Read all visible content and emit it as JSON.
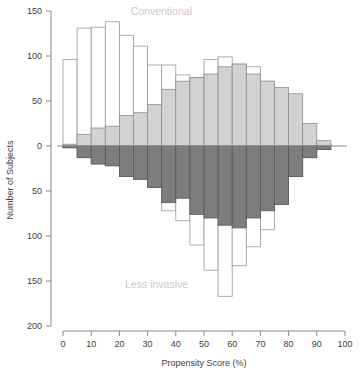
{
  "chart_data": {
    "type": "bar",
    "subtype": "back-to-back-histogram",
    "title": "",
    "xlabel": "Propensity Score (%)",
    "ylabel": "Number of Subjects",
    "xlim": [
      0,
      100
    ],
    "ylim": [
      -200,
      150
    ],
    "grid": false,
    "legend_position": "inside-annotations",
    "x_ticks": [
      0,
      10,
      20,
      30,
      40,
      50,
      60,
      70,
      80,
      90,
      100
    ],
    "x_tick_labels": [
      "0",
      "10",
      "20",
      "30",
      "40",
      "50",
      "60",
      "70",
      "80",
      "90",
      "100"
    ],
    "y_ticks": [
      150,
      100,
      50,
      0,
      -50,
      -100,
      -150,
      -200
    ],
    "y_tick_labels": [
      "150",
      "100",
      "50",
      "0",
      "50",
      "100",
      "150",
      "200"
    ],
    "annotations": [
      {
        "text": "Conventional",
        "x": 24,
        "y": 146,
        "color": "#c9c9c9"
      },
      {
        "text": "Less invasive",
        "x": 22,
        "y": -158,
        "color": "#c9c9c9"
      }
    ],
    "bin_width": 5,
    "bin_starts": [
      0,
      5,
      10,
      15,
      20,
      25,
      30,
      35,
      40,
      45,
      50,
      55,
      60,
      65,
      70,
      75,
      80,
      85,
      90,
      95
    ],
    "series": [
      {
        "name": "Conventional (upward, open outline)",
        "direction": "up",
        "style": "open",
        "values": [
          96,
          131,
          132,
          138,
          123,
          111,
          90,
          90,
          79,
          76,
          96,
          99,
          91,
          88,
          72,
          43,
          15,
          5,
          2,
          0
        ]
      },
      {
        "name": "Conventional overlap (upward, light gray fill)",
        "direction": "up",
        "style": "light",
        "values": [
          2,
          13,
          20,
          22,
          34,
          37,
          46,
          63,
          72,
          76,
          80,
          88,
          91,
          80,
          72,
          65,
          58,
          25,
          6,
          0
        ]
      },
      {
        "name": "Less invasive overlap (downward, dark gray fill)",
        "direction": "down",
        "style": "dark",
        "values": [
          2,
          13,
          20,
          22,
          34,
          37,
          46,
          63,
          58,
          76,
          80,
          88,
          91,
          80,
          72,
          65,
          34,
          13,
          4,
          0
        ]
      },
      {
        "name": "Less invasive (downward, open outline)",
        "direction": "down",
        "style": "open",
        "values": [
          2,
          13,
          20,
          22,
          34,
          37,
          46,
          72,
          83,
          110,
          138,
          167,
          133,
          112,
          93,
          65,
          34,
          13,
          4,
          0
        ]
      }
    ]
  }
}
